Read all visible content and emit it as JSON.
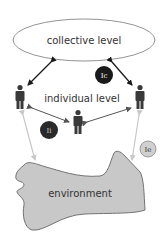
{
  "diagram": {
    "nodes": {
      "collective": {
        "label": "collective level"
      },
      "individual": {
        "label": "individual level"
      },
      "environment": {
        "label": "environment"
      }
    },
    "badges": {
      "ic": {
        "label": "Ic",
        "fill": "#1a1a1a",
        "text_color": "#ffffff"
      },
      "ii": {
        "label": "Ii",
        "fill": "#2a2a2a",
        "text_color": "#cccccc"
      },
      "ie": {
        "label": "Ie",
        "fill": "#d0d0d0",
        "text_color": "#333333"
      }
    },
    "people": [
      {
        "id": "person-left"
      },
      {
        "id": "person-right"
      },
      {
        "id": "person-center"
      }
    ],
    "colors": {
      "dark_arrow": "#1a1a1a",
      "individual_arrow": "#555555",
      "light_arrow": "#c8c8c8",
      "environment_fill": "#c8c8c8",
      "person": "#3a3a3a"
    }
  }
}
